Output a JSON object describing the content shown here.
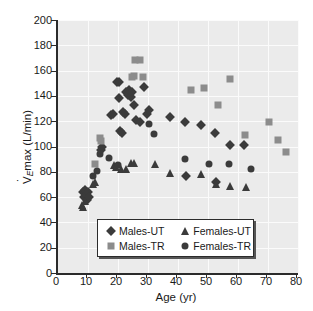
{
  "chart_data": {
    "type": "scatter",
    "title": "",
    "xlabel": "Age (yr)",
    "ylabel": "VEmax (L/min)",
    "xlim": [
      0,
      80
    ],
    "ylim": [
      0,
      200
    ],
    "xticks": [
      0,
      10,
      20,
      30,
      40,
      50,
      60,
      70,
      80
    ],
    "yticks": [
      0,
      20,
      40,
      60,
      80,
      100,
      120,
      140,
      160,
      180,
      200
    ],
    "grid": true,
    "legend_position": "lower-center",
    "colors": {
      "males_ut": "#3b3b3b",
      "males_tr": "#8c8c8c",
      "females_ut": "#3b3b3b",
      "females_tr": "#3b3b3b",
      "plot_background": "#ebebeb",
      "gridline": "#fbfbfb",
      "axis": "#2b2b2b"
    },
    "series": [
      {
        "name": "Males-UT",
        "marker": "diamond",
        "color": "#3b3b3b",
        "points": [
          [
            8.2,
            64
          ],
          [
            8.6,
            60
          ],
          [
            9.0,
            66
          ],
          [
            9.3,
            62
          ],
          [
            9.6,
            58
          ],
          [
            10.0,
            64
          ],
          [
            10.4,
            60
          ],
          [
            14.2,
            97
          ],
          [
            14.6,
            100
          ],
          [
            17.8,
            125
          ],
          [
            18.4,
            126
          ],
          [
            19.6,
            151
          ],
          [
            20.2,
            151
          ],
          [
            20.4,
            138
          ],
          [
            20.8,
            112
          ],
          [
            21.2,
            111
          ],
          [
            21.6,
            127
          ],
          [
            22.2,
            126
          ],
          [
            22.6,
            143
          ],
          [
            23.2,
            141
          ],
          [
            23.6,
            145
          ],
          [
            24.2,
            139
          ],
          [
            24.6,
            143
          ],
          [
            25.2,
            133
          ],
          [
            26.0,
            121
          ],
          [
            27.4,
            119
          ],
          [
            28.8,
            147
          ],
          [
            29.6,
            126
          ],
          [
            30.4,
            129
          ],
          [
            37.2,
            123
          ],
          [
            42.4,
            119
          ],
          [
            42.8,
            77
          ],
          [
            47.6,
            117
          ],
          [
            52.4,
            111
          ],
          [
            52.8,
            72
          ],
          [
            57.2,
            101
          ],
          [
            62.0,
            101
          ]
        ]
      },
      {
        "name": "Males-TR",
        "marker": "square",
        "color": "#8c8c8c",
        "points": [
          [
            12.2,
            86
          ],
          [
            14.0,
            107
          ],
          [
            14.4,
            104
          ],
          [
            24.6,
            155
          ],
          [
            25.4,
            156
          ],
          [
            25.8,
            168
          ],
          [
            27.2,
            168
          ],
          [
            28.4,
            155
          ],
          [
            44.2,
            145
          ],
          [
            48.6,
            146
          ],
          [
            53.2,
            133
          ],
          [
            62.2,
            109
          ],
          [
            57.4,
            153
          ],
          [
            70.2,
            119
          ],
          [
            73.4,
            105
          ],
          [
            76.0,
            96
          ]
        ]
      },
      {
        "name": "Females-UT",
        "marker": "triangle",
        "color": "#3b3b3b",
        "points": [
          [
            8.0,
            54
          ],
          [
            8.4,
            52
          ],
          [
            9.0,
            57
          ],
          [
            11.8,
            70
          ],
          [
            12.2,
            72
          ],
          [
            18.6,
            85
          ],
          [
            19.2,
            84
          ],
          [
            21.0,
            82
          ],
          [
            22.6,
            82
          ],
          [
            24.4,
            87
          ],
          [
            25.2,
            87
          ],
          [
            32.4,
            86
          ],
          [
            37.4,
            79
          ],
          [
            47.6,
            78
          ],
          [
            52.6,
            70
          ],
          [
            57.4,
            69
          ],
          [
            62.6,
            68
          ]
        ]
      },
      {
        "name": "Females-TR",
        "marker": "circle",
        "color": "#3b3b3b",
        "points": [
          [
            11.6,
            77
          ],
          [
            13.0,
            81
          ],
          [
            14.0,
            94
          ],
          [
            17.0,
            91
          ],
          [
            20.0,
            85
          ],
          [
            30.2,
            118
          ],
          [
            32.0,
            110
          ],
          [
            42.2,
            90
          ],
          [
            50.2,
            86
          ],
          [
            57.0,
            86
          ],
          [
            64.2,
            82
          ]
        ]
      }
    ]
  },
  "legend": {
    "rows": [
      [
        {
          "label": "Males-UT",
          "marker": "diamond"
        },
        {
          "label": "Females-UT",
          "marker": "triangle"
        }
      ],
      [
        {
          "label": "Males-TR",
          "marker": "square"
        },
        {
          "label": "Females-TR",
          "marker": "circle"
        }
      ]
    ]
  },
  "ylabel_parts": {
    "v": "V",
    "sub": "E",
    "rest": "max (L/min)"
  }
}
